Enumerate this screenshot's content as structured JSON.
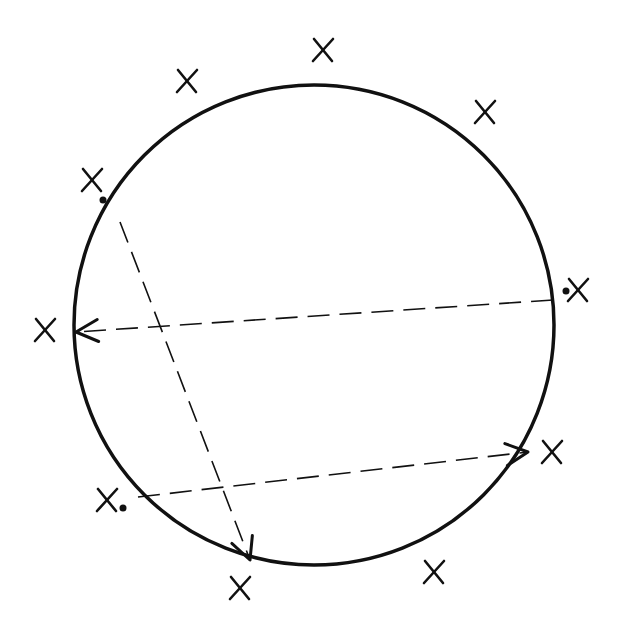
{
  "diagram": {
    "circle": {
      "cx": 314,
      "cy": 325,
      "r": 240,
      "stroke": "#111111"
    },
    "marks": [
      {
        "label": "X",
        "x": 323,
        "y": 50
      },
      {
        "label": "X",
        "x": 187,
        "y": 81
      },
      {
        "label": "X",
        "x": 485,
        "y": 112
      },
      {
        "label": "X",
        "x": 92,
        "y": 180,
        "dot": [
          103,
          200
        ]
      },
      {
        "label": "X",
        "x": 578,
        "y": 290,
        "dot": [
          566,
          291
        ]
      },
      {
        "label": "X",
        "x": 45,
        "y": 330
      },
      {
        "label": "X",
        "x": 552,
        "y": 452
      },
      {
        "label": "X",
        "x": 107,
        "y": 500,
        "dot": [
          123,
          508
        ]
      },
      {
        "label": "X",
        "x": 434,
        "y": 572
      },
      {
        "label": "X",
        "x": 240,
        "y": 588
      }
    ],
    "chords": [
      {
        "from": [
          553,
          300
        ],
        "to": [
          76,
          332
        ],
        "arrow": "end"
      },
      {
        "from": [
          120,
          222
        ],
        "to": [
          250,
          560
        ],
        "arrow": "end"
      },
      {
        "from": [
          138,
          497
        ],
        "to": [
          528,
          452
        ],
        "arrow": "end"
      }
    ]
  }
}
